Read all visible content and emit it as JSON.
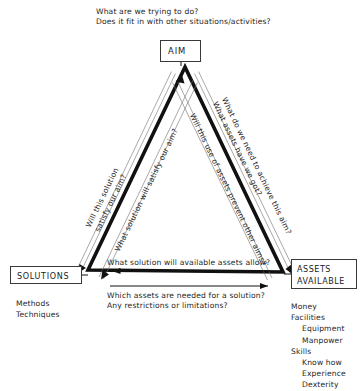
{
  "diagram": {
    "title_artifact": "",
    "nodes": {
      "aim": {
        "label": "AIM"
      },
      "solutions": {
        "label": "SOLUTIONS"
      },
      "assets": {
        "label_line1": "ASSETS",
        "label_line2": "AVAILABLE"
      }
    },
    "top_questions": {
      "line1": "What are we trying to do?",
      "line2": "Does it fit in with other situations/activities?"
    },
    "left_edge": {
      "outer_line1": "Will this solution",
      "outer_line2": "satisfy our aim?",
      "inner_line1": "What solution will satisfy our aim?"
    },
    "right_edge": {
      "outer_line1": "What do we need to achieve this aim?",
      "outer_line2": "What assets have we got?",
      "inner_line1": "Will this use of assets prevent other aims?"
    },
    "bottom_edge": {
      "above_arrow": "What solution will available assets allow?",
      "below_arrow_line1": "Which assets are needed for a solution?",
      "below_arrow_line2": "Any restrictions or limitations?"
    },
    "solutions_list": [
      {
        "text": "Methods",
        "indent": 0
      },
      {
        "text": "Techniques",
        "indent": 0
      }
    ],
    "assets_list": [
      {
        "text": "Money",
        "indent": 0
      },
      {
        "text": "Facilities",
        "indent": 0
      },
      {
        "text": "Equipment",
        "indent": 1
      },
      {
        "text": "Manpower",
        "indent": 1
      },
      {
        "text": "Skills",
        "indent": 0
      },
      {
        "text": "Know how",
        "indent": 1
      },
      {
        "text": "Experience",
        "indent": 1
      },
      {
        "text": "Dexterity",
        "indent": 1
      }
    ],
    "colors": {
      "ink": "#1a1a1a",
      "text": "#262626",
      "triangle": "#111111",
      "arrow": "#111111",
      "box_border": "#3a3a3a",
      "background": "#ffffff"
    }
  }
}
